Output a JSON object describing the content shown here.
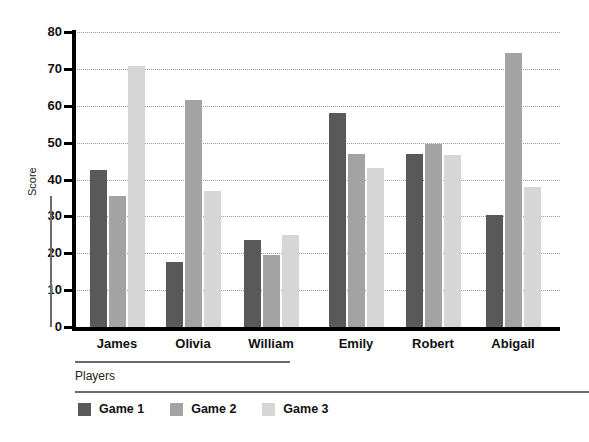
{
  "chart_data": {
    "type": "bar",
    "title": "",
    "xlabel": "Players",
    "ylabel": "Score",
    "ylim": [
      0,
      80
    ],
    "yticks": [
      0,
      10,
      20,
      30,
      40,
      50,
      60,
      70,
      80
    ],
    "grid": true,
    "legend_position": "bottom-left",
    "categories": [
      "James",
      "Olivia",
      "William",
      "Emily",
      "Robert",
      "Abigail"
    ],
    "series": [
      {
        "name": "Game 1",
        "color": "#595959",
        "values": [
          42.5,
          17.5,
          23.7,
          58.0,
          47.0,
          30.5
        ]
      },
      {
        "name": "Game 2",
        "color": "#a3a3a3",
        "values": [
          35.5,
          61.5,
          19.6,
          47.0,
          49.6,
          74.3
        ]
      },
      {
        "name": "Game 3",
        "color": "#d6d6d6",
        "values": [
          70.7,
          37.0,
          24.9,
          43.2,
          46.7,
          38.0
        ]
      }
    ]
  },
  "axes": {
    "y_label": "Score",
    "x_label": "Players",
    "tick_labels": [
      "80",
      "70",
      "60",
      "50",
      "40",
      "30",
      "20",
      "10",
      "0"
    ]
  },
  "legend": {
    "items": [
      {
        "label": "Game 1",
        "color": "#595959"
      },
      {
        "label": "Game 2",
        "color": "#a3a3a3"
      },
      {
        "label": "Game 3",
        "color": "#d6d6d6"
      }
    ]
  }
}
